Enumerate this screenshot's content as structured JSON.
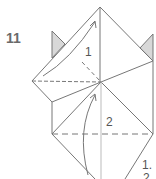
{
  "diagram": {
    "step_number": "11",
    "labels": {
      "fold1": "1",
      "fold2": "2",
      "note_line1": "1.",
      "note_line2": "2"
    },
    "colors": {
      "line": "#777777",
      "shade": "#d8d8d8",
      "text": "#6a6a6a"
    }
  }
}
